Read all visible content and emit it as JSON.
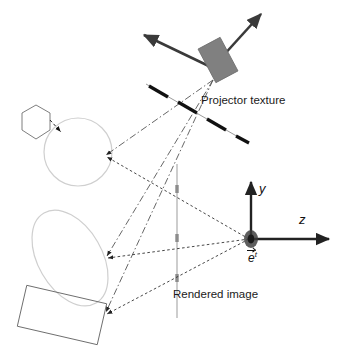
{
  "diagram": {
    "labels": {
      "projector_texture": "Projector texture",
      "rendered_image": "Rendered image",
      "axis_y": "y",
      "axis_z": "z",
      "eye_point_base": "e",
      "eye_point_superscript": "t"
    },
    "colors": {
      "background": "#ffffff",
      "projector_body": "#808080",
      "arrow_dark": "#3a3a3a",
      "texture_dash": "#111111",
      "texture_line": "#9a9a9a",
      "scene_light": "#cfcfcf",
      "scene_dark": "#555555",
      "ray_view": "#444444",
      "ray_projector": "#555555",
      "image_plane": "#b8b8b8",
      "axis": "#222222",
      "eye_dot": "#3a3a3a"
    },
    "elements": {
      "projector": {
        "name": "projector-body",
        "cx": 218,
        "cy": 60,
        "w": 25,
        "h": 38,
        "rotation": -28
      },
      "projector_arrow_up_right": {
        "from": [
          222,
          57
        ],
        "to": [
          262,
          13
        ]
      },
      "projector_arrow_left": {
        "from": [
          214,
          68
        ],
        "to": [
          143,
          34
        ]
      },
      "projector_apex": [
        213,
        80
      ],
      "texture_plane": {
        "from": [
          146,
          84
        ],
        "to": [
          247,
          142
        ]
      },
      "image_plane": {
        "from": [
          177,
          164
        ],
        "to": [
          177,
          318
        ]
      },
      "image_plane_ticks": [
        189,
        238,
        278
      ],
      "eye_point": [
        251,
        239
      ],
      "axis_y": {
        "from": [
          251,
          239
        ],
        "to": [
          251,
          181
        ]
      },
      "axis_z": {
        "from": [
          251,
          239
        ],
        "to": [
          330,
          239
        ]
      },
      "hexagon": {
        "cx": 36,
        "cy": 122,
        "r": 17
      },
      "circle": {
        "cx": 78,
        "cy": 152,
        "r": 34
      },
      "ellipse": {
        "cx": 70,
        "cy": 258,
        "rx": 32,
        "ry": 52,
        "rotation": -30
      },
      "rectangle": {
        "cx": 62,
        "cy": 315,
        "w": 82,
        "h": 42,
        "rotation": 13
      }
    },
    "ray_targets": {
      "circle_hit": [
        104,
        155
      ],
      "ellipse_hit": [
        105,
        255
      ],
      "rect_hit": [
        104,
        311
      ],
      "hexagon_hit": [
        53,
        135
      ]
    }
  }
}
